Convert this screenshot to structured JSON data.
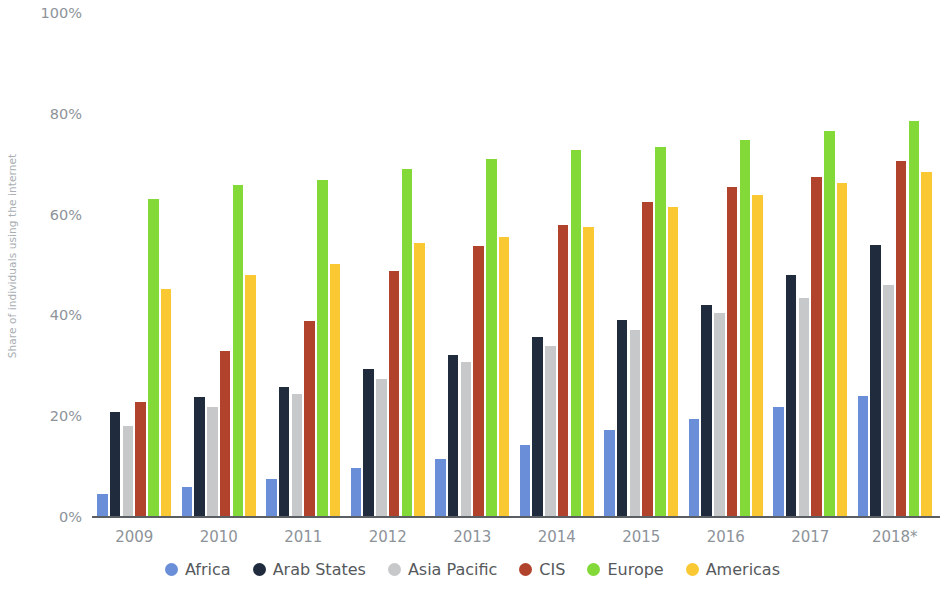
{
  "chart_data": {
    "type": "bar",
    "title": "",
    "subtitle": "",
    "xlabel": "",
    "ylabel": "Share of individuals using the internet",
    "ylim": [
      0,
      100
    ],
    "ytick_labels": [
      "0%",
      "20%",
      "40%",
      "60%",
      "80%",
      "100%"
    ],
    "ytick_values": [
      0,
      20,
      40,
      60,
      80,
      100
    ],
    "grid": false,
    "legend_position": "bottom",
    "value_suffix": "%",
    "categories": [
      "2009",
      "2010",
      "2011",
      "2012",
      "2013",
      "2014",
      "2015",
      "2016",
      "2017",
      "2018*"
    ],
    "series": [
      {
        "name": "Africa",
        "color": "#6a8fd8",
        "values": [
          4.5,
          6.0,
          7.5,
          9.8,
          11.5,
          14.3,
          17.3,
          19.4,
          21.8,
          24.0
        ]
      },
      {
        "name": "Arab States",
        "color": "#212b3e",
        "values": [
          20.8,
          23.8,
          25.8,
          29.3,
          32.2,
          35.7,
          39.0,
          42.0,
          48.0,
          54.0
        ]
      },
      {
        "name": "Asia Pacific",
        "color": "#c6c8ca",
        "values": [
          18.0,
          21.8,
          24.5,
          27.4,
          30.8,
          34.0,
          37.2,
          40.4,
          43.5,
          46.0
        ]
      },
      {
        "name": "CIS",
        "color": "#b1422c",
        "values": [
          22.8,
          33.0,
          38.8,
          48.8,
          53.8,
          58.0,
          62.5,
          65.5,
          67.5,
          70.6
        ]
      },
      {
        "name": "Europe",
        "color": "#82d938",
        "values": [
          63.0,
          65.8,
          66.8,
          69.0,
          71.0,
          72.8,
          73.5,
          74.8,
          76.5,
          78.5
        ]
      },
      {
        "name": "Americas",
        "color": "#fac832",
        "values": [
          45.3,
          48.0,
          50.2,
          54.3,
          55.5,
          57.5,
          61.5,
          63.8,
          66.3,
          68.5
        ]
      }
    ]
  },
  "legend": {
    "items": [
      {
        "label": "Africa",
        "color": "#6a8fd8"
      },
      {
        "label": "Arab States",
        "color": "#212b3e"
      },
      {
        "label": "Asia Pacific",
        "color": "#c6c8ca"
      },
      {
        "label": "CIS",
        "color": "#b1422c"
      },
      {
        "label": "Europe",
        "color": "#82d938"
      },
      {
        "label": "Americas",
        "color": "#fac832"
      }
    ]
  }
}
